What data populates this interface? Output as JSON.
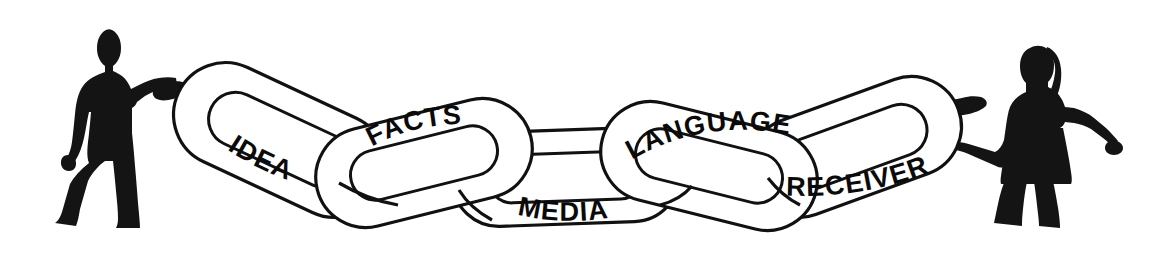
{
  "illustration": {
    "title": "Communication Chain",
    "background_color": "#ffffff",
    "ink_color": "#111111",
    "style": "black-and-white line art clipart"
  },
  "figures": [
    {
      "id": "sender",
      "name": "man-silhouette",
      "side": "left",
      "description": "Standing man in silhouette, left hand on hip, right arm extended holding the first chain link",
      "color": "#141414"
    },
    {
      "id": "receiver",
      "name": "woman-silhouette",
      "side": "right",
      "description": "Standing woman in silhouette wearing a skirt, left arm extended holding the last chain link, right arm out to the side",
      "color": "#141414"
    }
  ],
  "chain": {
    "link_count": 5,
    "links": [
      {
        "id": "link-idea",
        "label": "IDEA",
        "order": 1,
        "orientation": "tilted-down-right",
        "label_position": "lower-band"
      },
      {
        "id": "link-facts",
        "label": "FACTS",
        "order": 2,
        "orientation": "tilted-up-right",
        "label_position": "upper-band"
      },
      {
        "id": "link-media",
        "label": "MEDIA",
        "order": 3,
        "orientation": "horizontal-low",
        "label_position": "lower-band"
      },
      {
        "id": "link-language",
        "label": "LANGUAGE",
        "order": 4,
        "orientation": "tilted-up-left",
        "label_position": "upper-band"
      },
      {
        "id": "link-receiver",
        "label": "RECEIVER",
        "order": 5,
        "orientation": "tilted-up-right",
        "label_position": "lower-band"
      }
    ]
  }
}
